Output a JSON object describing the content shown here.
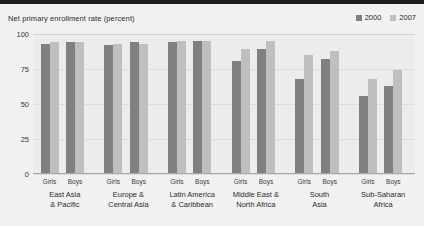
{
  "chart_data": {
    "type": "bar",
    "title": "Net primary enrollment rate (percent)",
    "xlabel": "",
    "ylabel": "",
    "ylim": [
      0,
      100
    ],
    "yticks": [
      0,
      25,
      50,
      75,
      100
    ],
    "ytick_labels": [
      "0",
      "25",
      "50",
      "75",
      "100"
    ],
    "grid": true,
    "legend_position": "top-right",
    "legend": [
      {
        "name": "2000",
        "color": "#808080"
      },
      {
        "name": "2007",
        "color": "#bfbfbf"
      }
    ],
    "categories": [
      "East Asia & Pacific",
      "Europe & Central Asia",
      "Latin America & Caribbean",
      "Middle East & North Africa",
      "South Asia",
      "Sub-Saharan Africa"
    ],
    "subcategories": [
      "Girls",
      "Boys"
    ],
    "series": [
      {
        "name": "2000",
        "color": "#808080",
        "values": [
          {
            "category": "East Asia & Pacific",
            "Girls": 93,
            "Boys": 94
          },
          {
            "category": "Europe & Central Asia",
            "Girls": 92,
            "Boys": 94
          },
          {
            "category": "Latin America & Caribbean",
            "Girls": 94,
            "Boys": 95
          },
          {
            "category": "Middle East & North Africa",
            "Girls": 81,
            "Boys": 89
          },
          {
            "category": "South Asia",
            "Girls": 68,
            "Boys": 82
          },
          {
            "category": "Sub-Saharan Africa",
            "Girls": 56,
            "Boys": 63
          }
        ]
      },
      {
        "name": "2007",
        "color": "#bfbfbf",
        "values": [
          {
            "category": "East Asia & Pacific",
            "Girls": 94,
            "Boys": 94
          },
          {
            "category": "Europe & Central Asia",
            "Girls": 93,
            "Boys": 93
          },
          {
            "category": "Latin America & Caribbean",
            "Girls": 95,
            "Boys": 95
          },
          {
            "category": "Middle East & North Africa",
            "Girls": 89,
            "Boys": 95
          },
          {
            "category": "South Asia",
            "Girls": 85,
            "Boys": 88
          },
          {
            "category": "Sub-Saharan Africa",
            "Girls": 68,
            "Boys": 74
          }
        ]
      }
    ],
    "region_label_lines": [
      [
        "East Asia",
        "& Pacific"
      ],
      [
        "Europe &",
        "Central Asia"
      ],
      [
        "Latin America",
        "& Caribbean"
      ],
      [
        "Middle East &",
        "North Africa"
      ],
      [
        "South",
        "Asia"
      ],
      [
        "Sub-Saharan",
        "Africa"
      ]
    ]
  },
  "colors": {
    "series_2000": "#808080",
    "series_2007": "#bfbfbf",
    "plot_background": "#ececec",
    "card_background": "#f1f1f1",
    "gridline": "#dcdcdc",
    "top_band": "#1c1c1c"
  }
}
